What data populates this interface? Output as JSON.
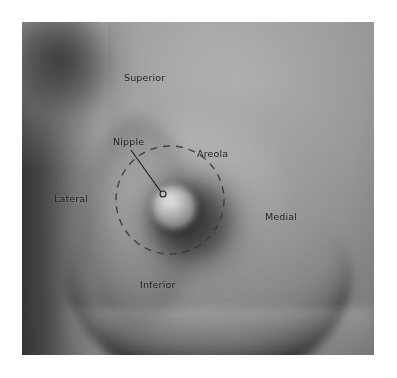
{
  "figure": {
    "kind": "anatomical-photograph",
    "view": "anterior",
    "background_color": "#ffffff",
    "plate": {
      "left": 22,
      "top": 22,
      "width": 352,
      "height": 333,
      "base_color": "#9a9a9a",
      "tone_range": [
        "#2a2a2a",
        "#d8d8d8"
      ]
    }
  },
  "labels": {
    "superior": "Superior",
    "inferior": "Inferior",
    "lateral": "Lateral",
    "medial": "Medial",
    "nipple": "Nipple",
    "areola": "Areola"
  },
  "markers": {
    "nipple_point": {
      "cx": 163,
      "cy": 194,
      "r": 3
    },
    "leader_line": {
      "x1": 131,
      "y1": 150,
      "x2": 161,
      "y2": 192
    },
    "areola_outline": {
      "cx": 170,
      "cy": 200,
      "rx": 54,
      "ry": 54,
      "style": "dashed",
      "color": "#3a3a3a",
      "dash": "7 6"
    }
  },
  "colors": {
    "label_text": "#1c1c1c",
    "annotation_stroke": "#1a1a1a",
    "areola_dash": "#3a3a3a",
    "page_background": "#ffffff"
  },
  "chart_data": {
    "type": "table",
    "categories": [
      "Superior",
      "Inferior",
      "Lateral",
      "Medial",
      "Nipple",
      "Areola"
    ],
    "values": [
      "upper margin",
      "lower margin",
      "outer margin",
      "inner margin",
      "central projection",
      "pigmented disc"
    ]
  }
}
